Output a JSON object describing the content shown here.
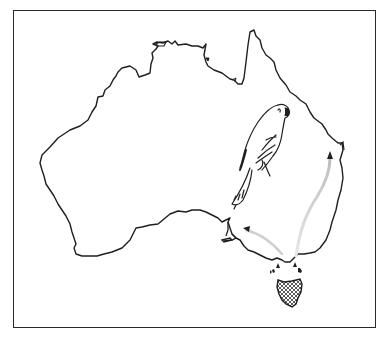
{
  "figure": {
    "breeding_area": "Tasmania (cross-hatched)",
    "migration": "arrows from Tasmania northward along south-eastern Australia"
  },
  "colors": {
    "outline": "#1f1f1f",
    "arrow_trail": "#c8c8c8",
    "background": "#ffffff",
    "frame": "#2a2a2a"
  },
  "labels": {
    "map_region": "Australia",
    "island": "Tasmania"
  }
}
